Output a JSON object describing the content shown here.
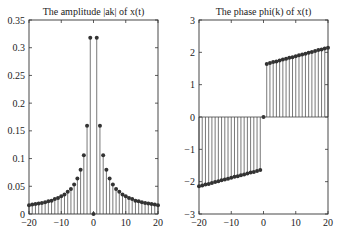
{
  "chart_data": [
    {
      "type": "stem",
      "title": "The amplitude |ak| of x(t)",
      "xlabel": "",
      "ylabel": "",
      "xlim": [
        -20,
        20
      ],
      "ylim": [
        0,
        0.35
      ],
      "xticks": [
        -20,
        -10,
        0,
        10,
        20
      ],
      "yticks": [
        0,
        0.05,
        0.1,
        0.15,
        0.2,
        0.25,
        0.3,
        0.35
      ],
      "xtick_labels": [
        "-20",
        "-10",
        "0",
        "10",
        "20"
      ],
      "ytick_labels": [
        "0",
        "0.05",
        "0.1",
        "0.15",
        "0.2",
        "0.25",
        "0.3",
        "0.35"
      ],
      "x": [
        -20,
        -19,
        -18,
        -17,
        -16,
        -15,
        -14,
        -13,
        -12,
        -11,
        -10,
        -9,
        -8,
        -7,
        -6,
        -5,
        -4,
        -3,
        -2,
        -1,
        0,
        1,
        2,
        3,
        4,
        5,
        6,
        7,
        8,
        9,
        10,
        11,
        12,
        13,
        14,
        15,
        16,
        17,
        18,
        19,
        20
      ],
      "values": [
        0.016,
        0.017,
        0.018,
        0.019,
        0.02,
        0.021,
        0.023,
        0.024,
        0.027,
        0.029,
        0.032,
        0.035,
        0.04,
        0.045,
        0.053,
        0.064,
        0.08,
        0.106,
        0.159,
        0.318,
        0,
        0.318,
        0.159,
        0.106,
        0.08,
        0.064,
        0.053,
        0.045,
        0.04,
        0.035,
        0.032,
        0.029,
        0.027,
        0.024,
        0.023,
        0.021,
        0.02,
        0.019,
        0.018,
        0.017,
        0.016
      ],
      "grid": false
    },
    {
      "type": "stem",
      "title": "The phase phi(k) of x(t)",
      "xlabel": "",
      "ylabel": "",
      "xlim": [
        -20,
        20
      ],
      "ylim": [
        -3,
        3
      ],
      "xticks": [
        -20,
        -10,
        0,
        10,
        20
      ],
      "yticks": [
        -3,
        -2,
        -1,
        0,
        1,
        2,
        3
      ],
      "xtick_labels": [
        "-20",
        "-10",
        "0",
        "10",
        "20"
      ],
      "ytick_labels": [
        "-3",
        "-2",
        "-1",
        "0",
        "1",
        "2",
        "3"
      ],
      "x": [
        -20,
        -19,
        -18,
        -17,
        -16,
        -15,
        -14,
        -13,
        -12,
        -11,
        -10,
        -9,
        -8,
        -7,
        -6,
        -5,
        -4,
        -3,
        -2,
        -1,
        0,
        1,
        2,
        3,
        4,
        5,
        6,
        7,
        8,
        9,
        10,
        11,
        12,
        13,
        14,
        15,
        16,
        17,
        18,
        19,
        20
      ],
      "values": [
        -2.14,
        -2.12,
        -2.09,
        -2.07,
        -2.04,
        -2.01,
        -1.99,
        -1.96,
        -1.93,
        -1.91,
        -1.88,
        -1.85,
        -1.83,
        -1.8,
        -1.78,
        -1.75,
        -1.72,
        -1.7,
        -1.67,
        -1.64,
        0,
        1.64,
        1.67,
        1.7,
        1.72,
        1.75,
        1.78,
        1.8,
        1.83,
        1.85,
        1.88,
        1.91,
        1.93,
        1.96,
        1.99,
        2.01,
        2.04,
        2.07,
        2.09,
        2.12,
        2.14
      ],
      "grid": false
    }
  ]
}
